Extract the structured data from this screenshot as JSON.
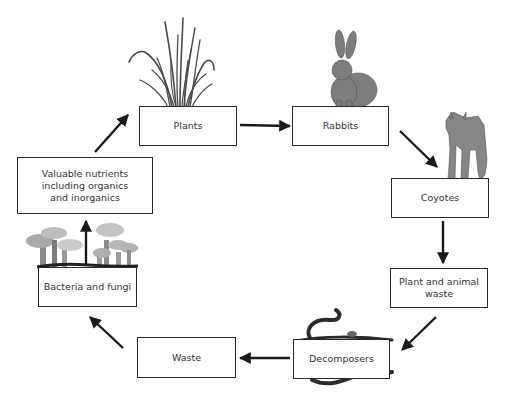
{
  "diagram": {
    "type": "cycle",
    "title_partial": "",
    "colors": {
      "box_border": "#2a2a2a",
      "arrow": "#1a1a1a",
      "animal_fill": "#7d7d7d",
      "grass": "#4a4a4a",
      "mushroom_light": "#b9b9b9",
      "mushroom_dark": "#8a8a8a"
    },
    "nodes": [
      {
        "id": "plants",
        "label": "Plants",
        "illustration": "grass-icon"
      },
      {
        "id": "rabbits",
        "label": "Rabbits",
        "illustration": "rabbit-icon"
      },
      {
        "id": "coyotes",
        "label": "Coyotes",
        "illustration": "coyote-icon"
      },
      {
        "id": "plant_animal_waste",
        "label": "Plant and animal\nwaste"
      },
      {
        "id": "decomposers",
        "label": "Decomposers",
        "illustration": "worm-icon"
      },
      {
        "id": "waste",
        "label": "Waste"
      },
      {
        "id": "bacteria_fungi",
        "label": "Bacteria and fungi",
        "illustration": "mushroom-icon"
      },
      {
        "id": "nutrients",
        "label": "Valuable nutrients\nincluding organics\nand inorganics"
      }
    ],
    "edges": [
      {
        "from": "plants",
        "to": "rabbits"
      },
      {
        "from": "rabbits",
        "to": "coyotes"
      },
      {
        "from": "coyotes",
        "to": "plant_animal_waste"
      },
      {
        "from": "plant_animal_waste",
        "to": "decomposers"
      },
      {
        "from": "decomposers",
        "to": "waste"
      },
      {
        "from": "waste",
        "to": "bacteria_fungi"
      },
      {
        "from": "bacteria_fungi",
        "to": "nutrients"
      },
      {
        "from": "nutrients",
        "to": "plants"
      }
    ]
  }
}
